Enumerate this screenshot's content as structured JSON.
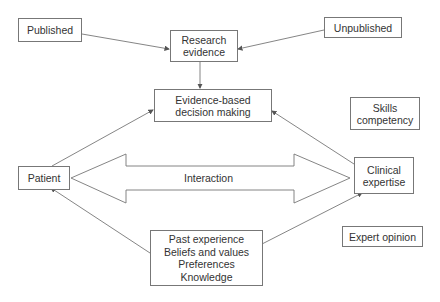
{
  "diagram": {
    "nodes": {
      "published": {
        "label": "Published"
      },
      "unpublished": {
        "label": "Unpublished"
      },
      "research": {
        "line1": "Research",
        "line2": "evidence"
      },
      "ebdm": {
        "line1": "Evidence-based",
        "line2": "decision making"
      },
      "skills": {
        "line1": "Skills",
        "line2": "competency"
      },
      "patient": {
        "label": "Patient"
      },
      "clinical": {
        "line1": "Clinical",
        "line2": "expertise"
      },
      "past": {
        "line1": "Past experience",
        "line2": "Beliefs and values",
        "line3": "Preferences",
        "line4": "Knowledge"
      },
      "expert": {
        "label": "Expert opinion"
      }
    },
    "interaction_label": "Interaction",
    "edges": [
      {
        "from": "Published",
        "to": "Research evidence"
      },
      {
        "from": "Unpublished",
        "to": "Research evidence"
      },
      {
        "from": "Research evidence",
        "to": "Evidence-based decision making"
      },
      {
        "from": "Patient",
        "to": "Evidence-based decision making"
      },
      {
        "from": "Clinical expertise",
        "to": "Evidence-based decision making"
      },
      {
        "from": "Past experience box",
        "to": "Patient"
      },
      {
        "from": "Past experience box",
        "to": "Clinical expertise"
      },
      {
        "between": [
          "Patient",
          "Clinical expertise"
        ],
        "type": "double-arrow",
        "label": "Interaction"
      }
    ],
    "colors": {
      "line": "#666666",
      "text": "#333333",
      "border": "#777777"
    }
  }
}
